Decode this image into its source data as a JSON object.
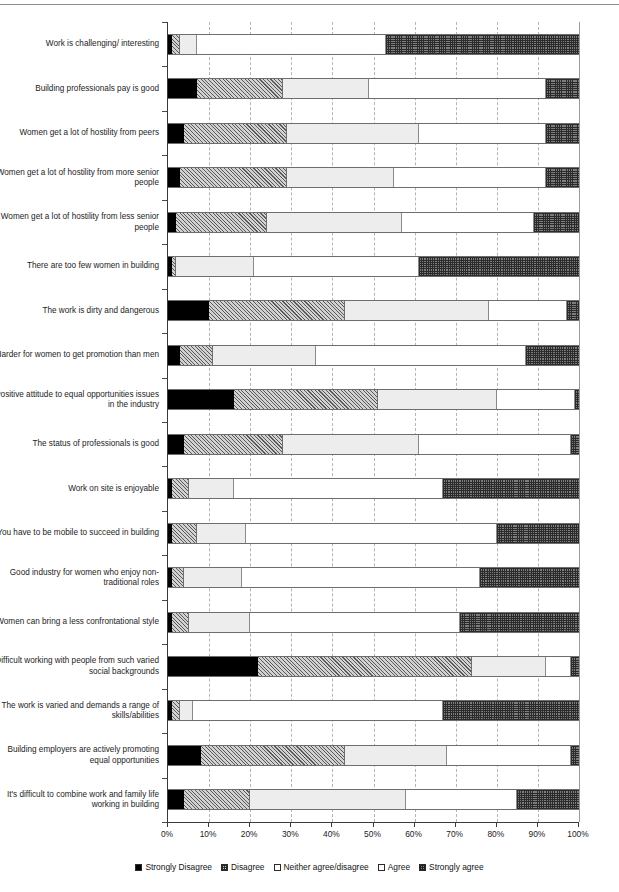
{
  "chart_data": {
    "type": "bar",
    "subtype": "stacked-horizontal-100pct",
    "title": "",
    "xlabel": "",
    "ylabel": "",
    "xlim": [
      0,
      100
    ],
    "xticks": [
      "0%",
      "10%",
      "20%",
      "30%",
      "40%",
      "50%",
      "60%",
      "70%",
      "80%",
      "90%",
      "100%"
    ],
    "grid": "vertical-dashed",
    "legend_position": "bottom-center",
    "legend": [
      "Strongly Disagree",
      "Disagree",
      "Neither agree/disagree",
      "Agree",
      "Strongly agree"
    ],
    "series": [
      {
        "name": "Strongly Disagree",
        "values": [
          1,
          7,
          4,
          3,
          2,
          1,
          10,
          3,
          16,
          4,
          1,
          1,
          1,
          1,
          22,
          1,
          8,
          4
        ]
      },
      {
        "name": "Disagree",
        "values": [
          2,
          21,
          25,
          26,
          22,
          1,
          33,
          8,
          35,
          24,
          4,
          6,
          3,
          4,
          52,
          2,
          35,
          16
        ]
      },
      {
        "name": "Neither agree/disagree",
        "values": [
          4,
          21,
          32,
          26,
          33,
          19,
          35,
          25,
          29,
          33,
          11,
          12,
          14,
          15,
          18,
          3,
          25,
          38
        ]
      },
      {
        "name": "Agree",
        "values": [
          46,
          43,
          31,
          37,
          32,
          40,
          19,
          51,
          19,
          37,
          51,
          61,
          58,
          51,
          6,
          61,
          30,
          27
        ]
      },
      {
        "name": "Strongly agree",
        "values": [
          47,
          8,
          8,
          8,
          11,
          39,
          3,
          13,
          1,
          2,
          33,
          20,
          24,
          29,
          2,
          33,
          2,
          15
        ]
      }
    ],
    "categories": [
      "Work is challenging/ interesting",
      "Building professionals pay is good",
      "Women get a lot of hostility from peers",
      "Women get a lot of hostility from more senior people",
      "Women get a lot of hostility from less senior people",
      "There are too few women in building",
      "The work is dirty and dangerous",
      "Harder for women to get promotion than men",
      "Positive attitude to equal opportunities issues in the industry",
      "The status of professionals is good",
      "Work on site is enjoyable",
      "You have to be mobile to succeed in building",
      "Good industry for women who enjoy non-traditional roles",
      "Women can bring a less confrontational style",
      "Difficult working with people from such varied social backgrounds",
      "The work is varied and demands a range of skills/abilities",
      "Building employers are actively promoting equal opportunities",
      "It's difficult to combine work and family life working in building"
    ]
  }
}
